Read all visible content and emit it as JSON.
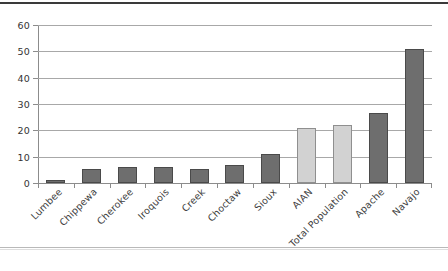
{
  "chart_data": {
    "type": "bar",
    "title": "",
    "subtitle": "",
    "xlabel": "",
    "ylabel": "",
    "ylim": [
      0,
      60
    ],
    "yticks": [
      0,
      10,
      20,
      30,
      40,
      50,
      60
    ],
    "grid": true,
    "legend": "none",
    "categories": [
      "Lumbee",
      "Chippewa",
      "Cherokee",
      "Iroquois",
      "Creek",
      "Choctaw",
      "Sioux",
      "AIAN",
      "Total Population",
      "Apache",
      "Navajo"
    ],
    "values": [
      1,
      5.5,
      6,
      6,
      5.5,
      7,
      11,
      21,
      22,
      26.5,
      51
    ],
    "bar_styles": [
      "dark",
      "dark",
      "dark",
      "dark",
      "dark",
      "dark",
      "dark",
      "light",
      "light",
      "dark",
      "dark"
    ]
  },
  "colors": {
    "bar_dark": "#6e6e6e",
    "bar_light": "#d2d2d2",
    "bar_border": "#4a4a4a",
    "gridline": "#a8a8a8",
    "axis": "#8c8c8c",
    "text": "#3d3d3d",
    "background": "#ffffff",
    "top_rule": "#3a3a3a"
  }
}
